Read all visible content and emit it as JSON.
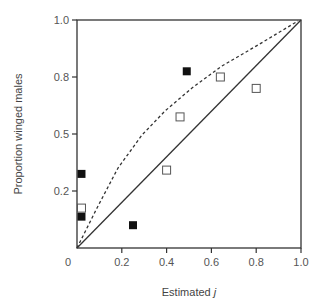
{
  "chart_data": {
    "type": "scatter",
    "title": "",
    "xlabel": "Estimated",
    "xlabel_italic_var": "j",
    "ylabel": "Proportion winged males",
    "xlim": [
      0,
      1.0
    ],
    "ylim": [
      0,
      1.0
    ],
    "grid": false,
    "legend": null,
    "x_ticks": [
      "0",
      "0.2",
      "0.4",
      "0.6",
      "0.8",
      "1.0"
    ],
    "y_ticks": [
      "0.2",
      "0.5",
      "0.8",
      "1.0"
    ],
    "y_scale_note": "y ticks evenly spaced at quarter positions (0.2, 0.5, 0.8, 1.0)",
    "series": [
      {
        "name": "filled squares",
        "marker": "filled-square",
        "color": "#111111",
        "points": [
          {
            "x": 0.02,
            "y": 0.29
          },
          {
            "x": 0.02,
            "y": 0.11
          },
          {
            "x": 0.25,
            "y": 0.08
          },
          {
            "x": 0.49,
            "y": 0.82
          }
        ]
      },
      {
        "name": "open squares",
        "marker": "open-square",
        "color": "#555555",
        "points": [
          {
            "x": 0.02,
            "y": 0.14
          },
          {
            "x": 0.4,
            "y": 0.31
          },
          {
            "x": 0.46,
            "y": 0.59
          },
          {
            "x": 0.64,
            "y": 0.8
          },
          {
            "x": 0.8,
            "y": 0.74
          }
        ]
      }
    ],
    "lines": [
      {
        "name": "1:1 line",
        "style": "solid",
        "color": "#333333",
        "points": [
          {
            "x": 0,
            "y": 0
          },
          {
            "x": 1.0,
            "y": 1.0
          }
        ]
      },
      {
        "name": "expected curve",
        "style": "dashed",
        "color": "#333333",
        "points_px": [
          [
            77,
            248
          ],
          [
            97,
            208
          ],
          [
            118,
            168
          ],
          [
            142,
            135
          ],
          [
            165,
            111
          ],
          [
            192,
            88
          ],
          [
            222,
            66
          ],
          [
            258,
            45
          ],
          [
            298,
            21
          ]
        ]
      }
    ]
  }
}
